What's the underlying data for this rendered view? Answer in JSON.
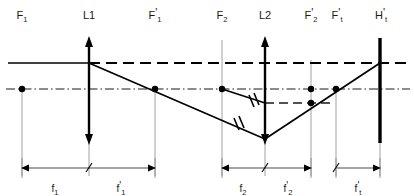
{
  "diagram": {
    "top_labels": [
      {
        "id": "F1",
        "base": "F",
        "sub": "1",
        "prime": false,
        "x": 22
      },
      {
        "id": "L1",
        "base": "L1",
        "sub": "",
        "prime": false,
        "x": 89
      },
      {
        "id": "F1p",
        "base": "F",
        "sub": "1",
        "prime": true,
        "x": 155
      },
      {
        "id": "F2",
        "base": "F",
        "sub": "2",
        "prime": false,
        "x": 222
      },
      {
        "id": "L2",
        "base": "L2",
        "sub": "",
        "prime": false,
        "x": 265
      },
      {
        "id": "F2p",
        "base": "F",
        "sub": "2",
        "prime": true,
        "x": 311
      },
      {
        "id": "Ftp",
        "base": "F",
        "sub": "t",
        "prime": true,
        "x": 336
      },
      {
        "id": "Htp",
        "base": "H",
        "sub": "t",
        "prime": true,
        "x": 380
      }
    ],
    "dimensions": [
      {
        "id": "f1",
        "base": "f",
        "sub": "1",
        "prime": false,
        "x1": 22,
        "x2": 89,
        "label_x": 55,
        "label_y": 190
      },
      {
        "id": "f1p",
        "base": "f",
        "sub": "1",
        "prime": true,
        "x1": 89,
        "x2": 155,
        "label_x": 120,
        "label_y": 190
      },
      {
        "id": "f2",
        "base": "f",
        "sub": "2",
        "prime": false,
        "x1": 222,
        "x2": 265,
        "label_x": 242,
        "label_y": 190
      },
      {
        "id": "f2p",
        "base": "f",
        "sub": "2",
        "prime": true,
        "x1": 265,
        "x2": 311,
        "label_x": 287,
        "label_y": 190
      },
      {
        "id": "ftp",
        "base": "f",
        "sub": "t",
        "prime": true,
        "x1": 336,
        "x2": 380,
        "label_x": 357,
        "label_y": 190
      }
    ],
    "colors": {
      "ink": "#1a1a1a",
      "ray": "#000000",
      "guide": "#7a7a7a",
      "axis": "#1a1a1a"
    },
    "geometry": {
      "label_row_y": 16,
      "incident_ray_y": 63,
      "optical_axis_y": 89,
      "aux_dash_y": 103,
      "dim_line_y": 168,
      "lens_top_y": 38,
      "lens_bottom_y": 143,
      "plane_top_y": 38,
      "plane_bottom_y": 143
    },
    "ray_nodes": [
      {
        "name": "object-point",
        "x": 22,
        "y": 89
      },
      {
        "name": "L1-intercept",
        "x": 89,
        "y": 63
      },
      {
        "name": "F1p-crossing",
        "x": 155,
        "y": 89
      },
      {
        "name": "F2-crossing",
        "x": 222,
        "y": 89
      },
      {
        "name": "L2-focus",
        "x": 265,
        "y": 139
      },
      {
        "name": "F2p-crossing",
        "x": 311,
        "y": 103
      },
      {
        "name": "Ftp-crossing",
        "x": 336,
        "y": 89
      },
      {
        "name": "image-point",
        "x": 380,
        "y": 63
      }
    ]
  }
}
